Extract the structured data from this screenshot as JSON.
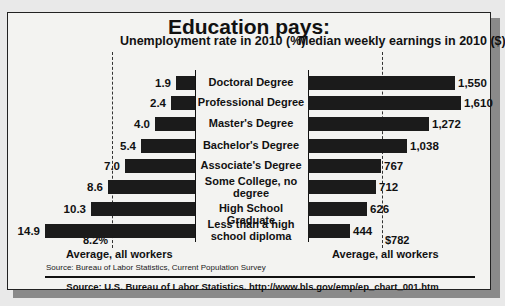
{
  "title": "Education pays:",
  "left_chart_title": "Unemployment rate in 2010 (%)",
  "right_chart_title": "Median weekly earnings in 2010 ($)",
  "left_average": {
    "value_label": "8.2%",
    "label": "Average, all workers"
  },
  "right_average": {
    "value_label": "$782",
    "label": "Average, all workers"
  },
  "source_small": "Source: Bureau of Labor Statistics, Current Population Survey",
  "source_main": "Source: U.S. Bureau of Labor Statistics.  http://www.bls.gov/emp/ep_chart_001.htm",
  "colors": {
    "bar": "#1b1b1b",
    "background": "#f3f3f1",
    "shadow": "#8a8a8a"
  },
  "chart_data": [
    {
      "type": "bar",
      "orientation": "horizontal",
      "title": "Unemployment rate in 2010 (%)",
      "categories": [
        "Doctoral Degree",
        "Professional Degree",
        "Master's Degree",
        "Bachelor's Degree",
        "Associate's Degree",
        "Some College, no degree",
        "High School Graduate",
        "Less than a high school diploma"
      ],
      "values": [
        1.9,
        2.4,
        4.0,
        5.4,
        7.0,
        8.6,
        10.3,
        14.9
      ],
      "value_labels": [
        "1.9",
        "2.4",
        "4.0",
        "5.4",
        "7.0",
        "8.6",
        "10.3",
        "14.9"
      ],
      "reference_line": {
        "value": 8.2,
        "label": "8.2%",
        "caption": "Average, all workers"
      },
      "xlabel": "",
      "ylabel": "",
      "grid": false
    },
    {
      "type": "bar",
      "orientation": "horizontal",
      "title": "Median weekly earnings in 2010 ($)",
      "categories": [
        "Doctoral Degree",
        "Professional Degree",
        "Master's Degree",
        "Bachelor's Degree",
        "Associate's Degree",
        "Some College, no degree",
        "High School Graduate",
        "Less than a high school diploma"
      ],
      "values": [
        1550,
        1610,
        1272,
        1038,
        767,
        712,
        626,
        444
      ],
      "value_labels": [
        "1,550",
        "1,610",
        "1,272",
        "1,038",
        "767",
        "712",
        "626",
        "444"
      ],
      "reference_line": {
        "value": 782,
        "label": "$782",
        "caption": "Average, all workers"
      },
      "xlabel": "",
      "ylabel": "",
      "grid": false
    }
  ],
  "rows": [
    {
      "category": "Doctoral Degree",
      "unemployment": "1.9",
      "earnings": "1,550"
    },
    {
      "category": "Professional Degree",
      "unemployment": "2.4",
      "earnings": "1,610"
    },
    {
      "category": "Master's Degree",
      "unemployment": "4.0",
      "earnings": "1,272"
    },
    {
      "category": "Bachelor's Degree",
      "unemployment": "5.4",
      "earnings": "1,038"
    },
    {
      "category": "Associate's Degree",
      "unemployment": "7.0",
      "earnings": "767"
    },
    {
      "category": "Some College, no degree",
      "unemployment": "8.6",
      "earnings": "712"
    },
    {
      "category": "High School Graduate",
      "unemployment": "10.3",
      "earnings": "626"
    },
    {
      "category": "Less than a high school diploma",
      "unemployment": "14.9",
      "earnings": "444"
    }
  ]
}
